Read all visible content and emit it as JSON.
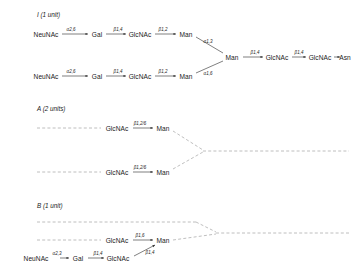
{
  "diagram": {
    "title_hidden": "N-glycan structures",
    "sections": [
      {
        "id": "I",
        "label": "I (1 unit)",
        "nodes": [
          {
            "name": "NeuNAc",
            "x": 46,
            "y": 34
          },
          {
            "name": "Gal",
            "x": 97,
            "y": 34
          },
          {
            "name": "GlcNAc",
            "x": 140,
            "y": 34
          },
          {
            "name": "Man",
            "x": 186,
            "y": 34
          },
          {
            "name": "NeuNAc",
            "x": 46,
            "y": 76
          },
          {
            "name": "Gal",
            "x": 97,
            "y": 76
          },
          {
            "name": "GlcNAc",
            "x": 140,
            "y": 76
          },
          {
            "name": "Man",
            "x": 186,
            "y": 76
          },
          {
            "name": "Man",
            "x": 232,
            "y": 57
          },
          {
            "name": "GlcNAc",
            "x": 277,
            "y": 57
          },
          {
            "name": "GlcNAc",
            "x": 320,
            "y": 57
          },
          {
            "name": "Asn",
            "x": 345,
            "y": 57
          }
        ],
        "links": [
          {
            "label": "α2,6",
            "x": 71,
            "y": 29
          },
          {
            "label": "β1,4",
            "x": 118,
            "y": 29
          },
          {
            "label": "β1,2",
            "x": 163,
            "y": 29
          },
          {
            "label": "α2,6",
            "x": 71,
            "y": 71
          },
          {
            "label": "β1,4",
            "x": 118,
            "y": 71
          },
          {
            "label": "β1,2",
            "x": 163,
            "y": 71
          },
          {
            "label": "α1,3",
            "x": 208,
            "y": 41
          },
          {
            "label": "α1,6",
            "x": 208,
            "y": 73
          },
          {
            "label": "β1,4",
            "x": 255,
            "y": 52
          },
          {
            "label": "β1,4",
            "x": 299,
            "y": 52
          }
        ]
      },
      {
        "id": "A",
        "label": "A (2 units)",
        "nodes": [
          {
            "name": "GlcNAc",
            "x": 117,
            "y": 128
          },
          {
            "name": "Man",
            "x": 163,
            "y": 128
          },
          {
            "name": "GlcNAc",
            "x": 117,
            "y": 172
          },
          {
            "name": "Man",
            "x": 163,
            "y": 172
          }
        ],
        "links": [
          {
            "label": "β1,2/6",
            "x": 140,
            "y": 123
          },
          {
            "label": "β1,2/6",
            "x": 140,
            "y": 167
          }
        ]
      },
      {
        "id": "B",
        "label": "B (1 unit)",
        "nodes": [
          {
            "name": "GlcNAc",
            "x": 117,
            "y": 240
          },
          {
            "name": "Man",
            "x": 163,
            "y": 240
          },
          {
            "name": "NeuNAc",
            "x": 36,
            "y": 258
          },
          {
            "name": "Gal",
            "x": 78,
            "y": 258
          },
          {
            "name": "GlcNAc",
            "x": 118,
            "y": 258
          }
        ],
        "links": [
          {
            "label": "β1,6",
            "x": 140,
            "y": 235
          },
          {
            "label": "α2,3",
            "x": 57,
            "y": 253
          },
          {
            "label": "β1,4",
            "x": 98,
            "y": 253
          },
          {
            "label": "β1,4",
            "x": 147,
            "y": 252
          }
        ]
      }
    ],
    "section_titles": [
      {
        "text": "I (1 unit)",
        "x": 37,
        "y": 14
      },
      {
        "text": "A (2 units)",
        "x": 37,
        "y": 108
      },
      {
        "text": "B (1 unit)",
        "x": 37,
        "y": 205
      }
    ]
  },
  "colors": {
    "solid_stroke": "#2a2a2a",
    "dashed_stroke": "#8a8a8a",
    "text": "#1a1a1a",
    "background": "#ffffff"
  }
}
